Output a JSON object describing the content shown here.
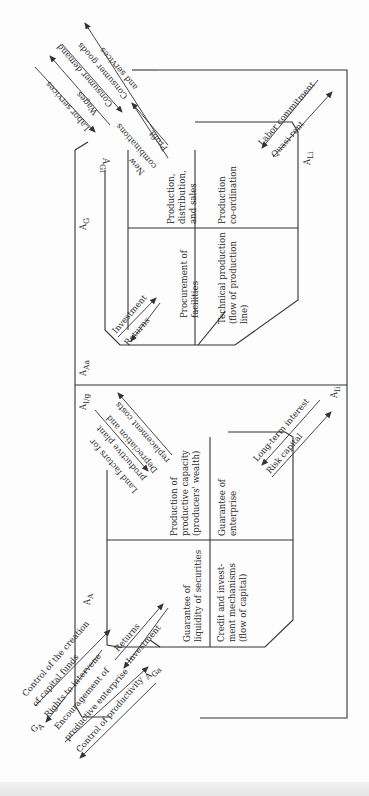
{
  "diagram": {
    "orientation": "rotated 90 degrees (text reads bottom-to-top)",
    "subsystem_labels": {
      "A_G": "A",
      "A_G_sub": "G",
      "A_A": "A",
      "A_A_sub": "A",
      "A_Aa": "A",
      "A_Aa_sub": "Aa",
      "A_Ig": "A",
      "A_Ig_sub": "I/g",
      "A_Ii": "A",
      "A_Ii_sub": "Ii",
      "A_Li": "A",
      "A_Li_sub": "Li",
      "A_Gi": "A",
      "A_Gi_sub": "Gi",
      "A_Ga": "A",
      "A_Ga_sub": "Ga",
      "G_A": "G",
      "G_A_sub": "A"
    },
    "goal_box": {
      "cells": [
        "Procurement of facilities",
        "Production, distribution, and sales",
        "Technical production (flow of production line)",
        "Production co-ordination"
      ],
      "cell_lines": [
        [
          "Procurement of",
          "facilities"
        ],
        [
          "Production,",
          "distribution,",
          "and sales"
        ],
        [
          "Technical production",
          "(flow of production",
          "line)"
        ],
        [
          "Production",
          "co-ordination"
        ]
      ]
    },
    "adaptation_box": {
      "cells": [
        "Guarantee of liquidity of securities",
        "Production of productive capacity (producers' wealth)",
        "Credit and investment mechanisms (flow of capital)",
        "Guarantee of enterprise"
      ],
      "cell_lines": [
        [
          "Guarantee of",
          "liquidity of securities"
        ],
        [
          "Production of",
          "productive capacity",
          "(producers' wealth)"
        ],
        [
          "Credit and invest-",
          "ment mechanisms",
          "(flow of capital)"
        ],
        [
          "Guarantee of",
          "enterprise"
        ]
      ]
    },
    "interchanges": {
      "top_left": [
        "Labor services",
        "Wages",
        "Consumer demand",
        "Consumer goods",
        "and services",
        "Profit",
        "New",
        "combinations"
      ],
      "goal_to_right": [
        "Labor commitment",
        "Quasi-rent"
      ],
      "goal_internal": [
        "Investment",
        "Returns"
      ],
      "adaptation_middle": [
        "Land factors for",
        "productive plant",
        "Depreciation and",
        "replacement costs"
      ],
      "adaptation_right": [
        "Long-term interest",
        "Risk capital"
      ],
      "adaptation_internal": [
        "Returns",
        "Investment"
      ],
      "bottom_left": [
        "Control of the creation",
        "of capital funds",
        "Rights to intervene",
        "Encouragement of",
        "productive enterprise",
        "Control of productivity"
      ]
    }
  }
}
